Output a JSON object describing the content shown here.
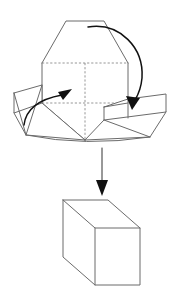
{
  "figure": {
    "caption": "",
    "background_color": "#ffffff",
    "line_color": "#6b6b6b",
    "hidden_line_color": "#8a8a8a",
    "arrow_color": "#111111"
  },
  "diagram_data": {
    "type": "line-art-geometric-diagram",
    "steps": [
      {
        "id": "unfolded-net",
        "label": "Partially folded cube net",
        "description": "Hexagonal silhouette formed by three visible cube faces with two side flaps spread outward"
      },
      {
        "id": "folded-cube",
        "label": "Assembled cube",
        "description": "Completed cube drawn in isometric projection"
      }
    ],
    "arrows": [
      {
        "id": "left-fold-arrow",
        "label": "fold left flap upward",
        "style": "curved",
        "direction": "up-right"
      },
      {
        "id": "right-fold-arrow",
        "label": "fold right flap downward",
        "style": "curved",
        "direction": "down-left"
      },
      {
        "id": "transform-arrow",
        "label": "becomes",
        "style": "straight",
        "direction": "down"
      }
    ]
  },
  "labels": {
    "top_shape": "",
    "bottom_shape": "",
    "left_arrow": "",
    "right_arrow": "",
    "down_arrow": ""
  }
}
